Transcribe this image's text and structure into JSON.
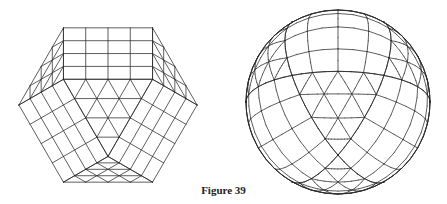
{
  "figure": {
    "caption": "Figure 39",
    "left_panel": {
      "description": "Subdivided cuboctahedron wireframe (square and triangular faces, 4 subdivisions per edge)",
      "subdivisions": 4,
      "center": [
        108,
        105
      ],
      "scale": 63
    },
    "right_panel": {
      "description": "Same subdivided grid projected onto a sphere",
      "subdivisions": 4,
      "center": [
        338,
        102
      ],
      "radius": 92
    },
    "line_color": "#2a2a2a",
    "background": "#ffffff"
  }
}
